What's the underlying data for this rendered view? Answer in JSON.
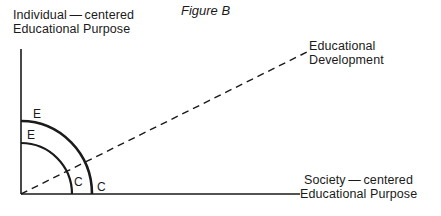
{
  "figure": {
    "title": "Figure B",
    "y_axis_label": [
      "Individual — centered",
      "Educational Purpose"
    ],
    "x_axis_label": [
      "Society — centered",
      "Educational Purpose"
    ],
    "diagonal_label": [
      "Educational",
      "Development"
    ],
    "arcs": [
      {
        "name": "inner",
        "top_label": "E",
        "bottom_label": "C"
      },
      {
        "name": "outer",
        "top_label": "E",
        "bottom_label": "C"
      }
    ],
    "colors": {
      "line": "#1a1a1a",
      "background": "#ffffff"
    }
  }
}
